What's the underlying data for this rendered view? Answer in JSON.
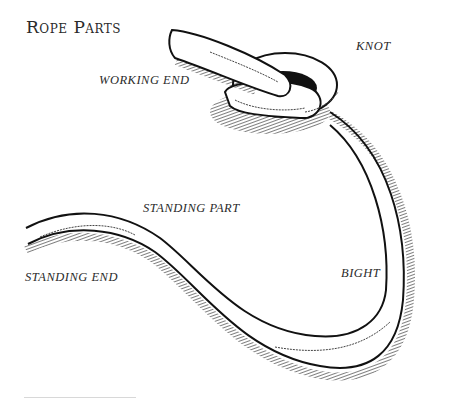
{
  "title": "Rope Parts",
  "labels": {
    "knot": "KNOT",
    "working_end": "WORKING END",
    "standing_part": "STANDING PART",
    "bight": "BIGHT",
    "standing_end": "STANDING END"
  },
  "colors": {
    "ink": "#111111",
    "text": "#2a2a2a",
    "background": "#ffffff"
  }
}
